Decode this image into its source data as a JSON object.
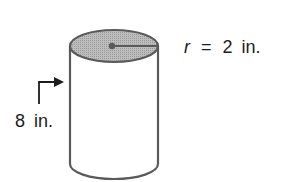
{
  "figure": {
    "shape": "cylinder",
    "radius_label": {
      "variable": "r",
      "equals": "=",
      "value": "2",
      "unit": "in."
    },
    "height_label": {
      "value": "8",
      "unit": "in."
    }
  },
  "colors": {
    "stroke": "#5a5a5a",
    "top_fill": "#b4b4b4",
    "text": "#1c1c1c",
    "background": "#ffffff"
  }
}
